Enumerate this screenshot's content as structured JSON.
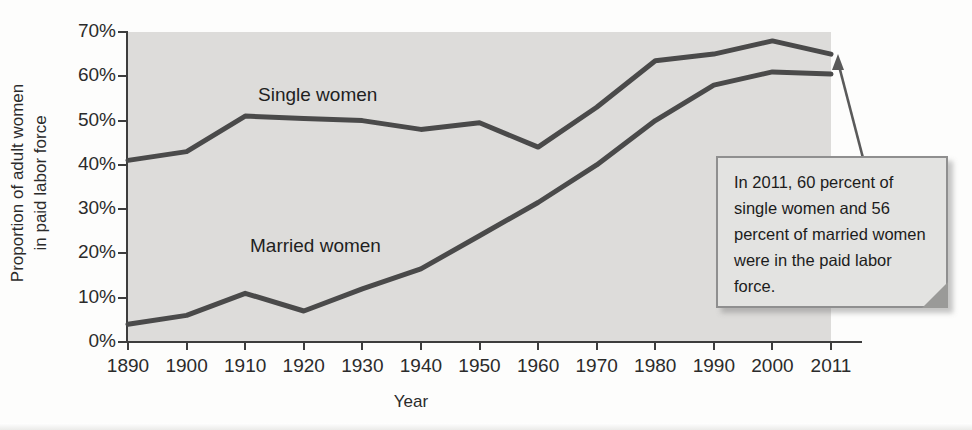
{
  "chart_data": {
    "type": "line",
    "title": "",
    "xlabel": "Year",
    "ylabel": "Proportion of adult women\nin paid labor force",
    "x": [
      1890,
      1900,
      1910,
      1920,
      1930,
      1940,
      1950,
      1960,
      1970,
      1980,
      1990,
      2000,
      2011
    ],
    "xtick_labels": [
      "1890",
      "1900",
      "1910",
      "1920",
      "1930",
      "1940",
      "1950",
      "1960",
      "1970",
      "1980",
      "1990",
      "2000",
      "2011"
    ],
    "ytick_labels": [
      "0%",
      "10%",
      "20%",
      "30%",
      "40%",
      "50%",
      "60%",
      "70%"
    ],
    "ytick_values": [
      0,
      10,
      20,
      30,
      40,
      50,
      60,
      70
    ],
    "ylim": [
      0,
      70
    ],
    "grid": false,
    "legend_position": "inline-labels",
    "series": [
      {
        "name": "Single women",
        "label": "Single women",
        "color": "#4a4a4a",
        "values": [
          41,
          43,
          51,
          50.5,
          50,
          48,
          49.5,
          44,
          53,
          63.5,
          65,
          68,
          65
        ]
      },
      {
        "name": "Married women",
        "label": "Married women",
        "color": "#4a4a4a",
        "values": [
          4,
          6,
          11,
          7,
          12,
          16.5,
          24,
          31.5,
          40,
          50,
          58,
          61,
          60.5
        ]
      }
    ],
    "annotations": [
      {
        "name": "callout-2011",
        "text": "In 2011, 60 percent of single women and 56 percent of married women were in the paid labor force.",
        "points_to_year": 2011
      }
    ]
  },
  "axes": {
    "y_title": "Proportion of adult women\nin paid labor force",
    "x_title": "Year",
    "y_ticks": [
      "70%",
      "60%",
      "50%",
      "40%",
      "30%",
      "20%",
      "10%",
      "0%"
    ],
    "x_ticks": [
      "1890",
      "1900",
      "1910",
      "1920",
      "1930",
      "1940",
      "1950",
      "1960",
      "1970",
      "1980",
      "1990",
      "2000",
      "2011"
    ]
  },
  "labels": {
    "single": "Single women",
    "married": "Married women"
  },
  "callout": {
    "text": "In 2011, 60 percent of single women and 56 percent of married women were in the paid labor force."
  },
  "colors": {
    "line": "#4a4a4a",
    "plot_background": "#dddcda",
    "axis": "#3d3d3d",
    "callout_fill": "#e3e3e1",
    "callout_border": "#8f8f8f",
    "page_background": "#fdfdfc"
  }
}
